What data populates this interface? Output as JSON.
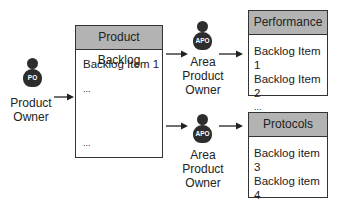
{
  "product_owner": {
    "badge": "PO",
    "label_line1": "Product",
    "label_line2": "Owner"
  },
  "product_backlog": {
    "title": "Product Backlog",
    "items": [
      "Backlog Item 1",
      "...",
      "..."
    ]
  },
  "area_product_owners": [
    {
      "badge": "APO",
      "label_line1": "Area",
      "label_line2": "Product",
      "label_line3": "Owner"
    },
    {
      "badge": "APO",
      "label_line1": "Area",
      "label_line2": "Product",
      "label_line3": "Owner"
    }
  ],
  "area_backlogs": [
    {
      "title": "Performance",
      "items": [
        "Backlog Item 1",
        "Backlog Item 2",
        "..."
      ]
    },
    {
      "title": "Protocols",
      "items": [
        "Backlog item 3",
        "Backlog item 4",
        "..."
      ]
    }
  ],
  "colors": {
    "header_fill": "#b3b3b3",
    "icon_fill": "#2d2d2d",
    "border": "#333333"
  }
}
